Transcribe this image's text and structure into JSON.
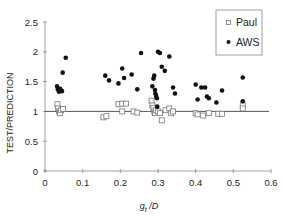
{
  "chart_data": {
    "type": "scatter",
    "title": "",
    "xlabel": "g_t /D",
    "xlabel_main": "g",
    "xlabel_sub": "t",
    "xlabel_rest": " /D",
    "ylabel": "TEST/PREDICTION",
    "xlim": [
      0,
      0.6
    ],
    "ylim": [
      0,
      2.5
    ],
    "xticks": [
      "0",
      "0.1",
      "0.2",
      "0.3",
      "0.4",
      "0.5",
      "0.6"
    ],
    "yticks": [
      "0",
      "0.5",
      "1",
      "1.5",
      "2",
      "2.5"
    ],
    "grid": false,
    "legend_position": "upper right",
    "reference_line": {
      "y": 1.0,
      "x_from": 0.0,
      "x_to": 0.6
    },
    "series": [
      {
        "name": "Paul",
        "marker": "open-square",
        "points": [
          [
            0.033,
            1.12
          ],
          [
            0.035,
            1.05
          ],
          [
            0.037,
            1.0
          ],
          [
            0.04,
            0.97
          ],
          [
            0.043,
            1.02
          ],
          [
            0.048,
            1.04
          ],
          [
            0.155,
            0.9
          ],
          [
            0.163,
            0.92
          ],
          [
            0.195,
            1.12
          ],
          [
            0.205,
            1.13
          ],
          [
            0.215,
            1.13
          ],
          [
            0.205,
            1.0
          ],
          [
            0.235,
            1.0
          ],
          [
            0.245,
            0.98
          ],
          [
            0.283,
            1.18
          ],
          [
            0.285,
            1.1
          ],
          [
            0.288,
            1.06
          ],
          [
            0.29,
            1.0
          ],
          [
            0.292,
            0.97
          ],
          [
            0.295,
            1.02
          ],
          [
            0.3,
            1.0
          ],
          [
            0.305,
            0.97
          ],
          [
            0.31,
            0.85
          ],
          [
            0.32,
            1.02
          ],
          [
            0.33,
            1.05
          ],
          [
            0.335,
            0.97
          ],
          [
            0.34,
            1.0
          ],
          [
            0.4,
            0.97
          ],
          [
            0.405,
            0.95
          ],
          [
            0.42,
            0.93
          ],
          [
            0.435,
            0.97
          ],
          [
            0.46,
            0.96
          ],
          [
            0.47,
            0.96
          ],
          [
            0.525,
            1.1
          ],
          [
            0.525,
            1.05
          ]
        ]
      },
      {
        "name": "AWS",
        "marker": "filled-circle",
        "points": [
          [
            0.032,
            1.42
          ],
          [
            0.034,
            1.37
          ],
          [
            0.037,
            1.33
          ],
          [
            0.04,
            1.38
          ],
          [
            0.043,
            1.35
          ],
          [
            0.045,
            1.34
          ],
          [
            0.047,
            1.65
          ],
          [
            0.055,
            1.9
          ],
          [
            0.16,
            1.6
          ],
          [
            0.17,
            1.52
          ],
          [
            0.195,
            1.47
          ],
          [
            0.205,
            1.72
          ],
          [
            0.21,
            1.56
          ],
          [
            0.23,
            1.62
          ],
          [
            0.245,
            1.37
          ],
          [
            0.255,
            1.98
          ],
          [
            0.285,
            1.42
          ],
          [
            0.288,
            1.55
          ],
          [
            0.29,
            1.6
          ],
          [
            0.292,
            1.36
          ],
          [
            0.293,
            1.3
          ],
          [
            0.295,
            1.26
          ],
          [
            0.297,
            1.22
          ],
          [
            0.298,
            1.08
          ],
          [
            0.3,
            2.0
          ],
          [
            0.305,
            1.98
          ],
          [
            0.31,
            1.75
          ],
          [
            0.318,
            1.68
          ],
          [
            0.33,
            1.92
          ],
          [
            0.34,
            1.4
          ],
          [
            0.345,
            1.3
          ],
          [
            0.4,
            1.45
          ],
          [
            0.405,
            1.2
          ],
          [
            0.415,
            1.4
          ],
          [
            0.425,
            1.4
          ],
          [
            0.43,
            1.25
          ],
          [
            0.435,
            1.22
          ],
          [
            0.455,
            1.15
          ],
          [
            0.47,
            1.35
          ],
          [
            0.525,
            1.57
          ],
          [
            0.525,
            1.17
          ]
        ]
      }
    ]
  },
  "legend": {
    "items": [
      {
        "label": "Paul",
        "marker": "open-square"
      },
      {
        "label": "AWS",
        "marker": "filled-circle"
      }
    ]
  },
  "colors": {
    "axis": "#888888",
    "refline": "#555555",
    "marker_fill": "#111111",
    "marker_open_stroke": "#777777",
    "legend_border": "#888888",
    "text": "#222222"
  }
}
